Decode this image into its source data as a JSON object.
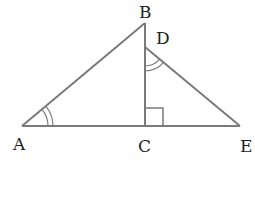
{
  "diagram": {
    "type": "geometry",
    "stroke_color": "#7a7a7a",
    "points": {
      "A": {
        "label": "A",
        "x": 22,
        "y": 126
      },
      "B": {
        "label": "B",
        "x": 145,
        "y": 23
      },
      "C": {
        "label": "C",
        "x": 145,
        "y": 126
      },
      "D": {
        "label": "D",
        "x": 145,
        "y": 47
      },
      "E": {
        "label": "E",
        "x": 240,
        "y": 126
      }
    },
    "segments": [
      "AB",
      "BC",
      "AE",
      "DE"
    ],
    "markers": {
      "right_angle": "C",
      "equal_angles": [
        "BAC",
        "BDE"
      ],
      "angle_arc_style": "double"
    }
  }
}
